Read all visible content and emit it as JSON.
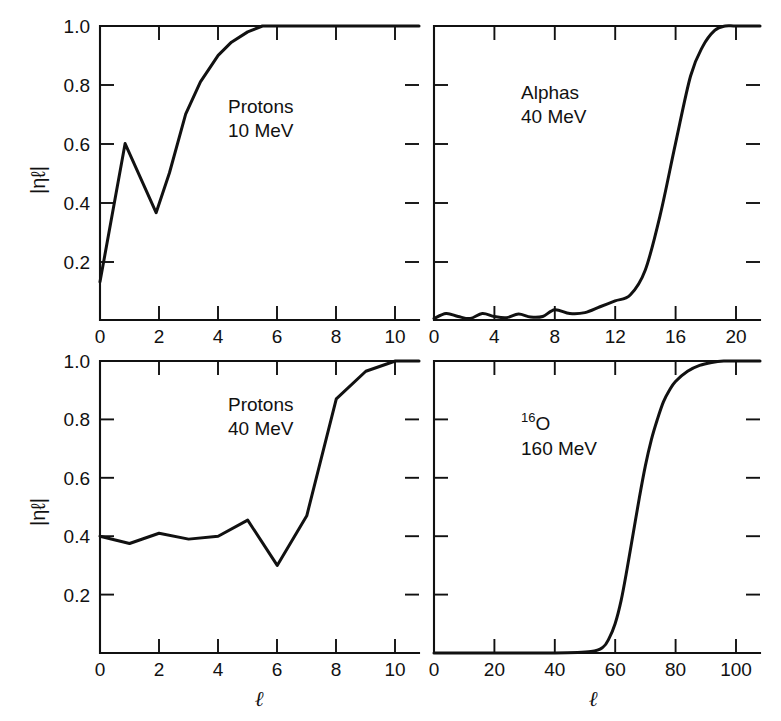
{
  "figure": {
    "background_color": "#ffffff",
    "line_color": "#111111",
    "text_color": "#111111",
    "y_axis_label": "|ηℓ|",
    "x_axis_label": "ℓ"
  },
  "panels": [
    {
      "id": "protons-10mev",
      "position": "top-left",
      "annotation_line1": "Protons",
      "annotation_line2": "10 MeV",
      "annotation_superscript": "",
      "annotation_base": ""
    },
    {
      "id": "alphas-40mev",
      "position": "top-right",
      "annotation_line1": "Alphas",
      "annotation_line2": "40 MeV",
      "annotation_superscript": "",
      "annotation_base": ""
    },
    {
      "id": "protons-40mev",
      "position": "bottom-left",
      "annotation_line1": "Protons",
      "annotation_line2": "40 MeV",
      "annotation_superscript": "",
      "annotation_base": ""
    },
    {
      "id": "o16-160mev",
      "position": "bottom-right",
      "annotation_line1": "",
      "annotation_line2": "160 MeV",
      "annotation_superscript": "16",
      "annotation_base": "O"
    }
  ],
  "chart_data": [
    {
      "type": "line",
      "panel_id": "protons-10mev",
      "title": "Protons 10 MeV",
      "xlabel": "ℓ",
      "ylabel": "|ηℓ|",
      "xlim": [
        0,
        10.8
      ],
      "ylim": [
        0.0,
        1.0
      ],
      "xticks": [
        0,
        2,
        4,
        6,
        8,
        10
      ],
      "xticklabels": [
        "0",
        "2",
        "4",
        "6",
        "8",
        "10"
      ],
      "yticks": [
        0.2,
        0.4,
        0.6,
        0.8,
        1.0
      ],
      "yticklabels": [
        "0.2",
        "0.4",
        "0.6",
        "0.8",
        "1.0"
      ],
      "grid": false,
      "legend": "none",
      "x": [
        0.0,
        0.85,
        1.9,
        2.35,
        2.9,
        3.4,
        4.0,
        4.45,
        5.0,
        5.5,
        6.0,
        8.0,
        10.0,
        10.8
      ],
      "y": [
        0.13,
        0.6,
        0.365,
        0.5,
        0.7,
        0.81,
        0.9,
        0.945,
        0.98,
        1.0,
        1.0,
        1.0,
        1.0,
        1.0
      ]
    },
    {
      "type": "line",
      "panel_id": "alphas-40mev",
      "title": "Alphas 40 MeV",
      "xlabel": "ℓ",
      "ylabel": "|ηℓ|",
      "xlim": [
        0,
        21.6
      ],
      "ylim": [
        0.0,
        1.0
      ],
      "xticks": [
        0,
        4,
        8,
        12,
        16,
        20
      ],
      "xticklabels": [
        "0",
        "4",
        "8",
        "12",
        "16",
        "20"
      ],
      "yticks": [
        0.2,
        0.4,
        0.6,
        0.8,
        1.0
      ],
      "yticklabels": [
        "",
        "",
        "",
        "",
        ""
      ],
      "grid": false,
      "legend": "none",
      "x": [
        0.0,
        0.8,
        1.6,
        2.4,
        3.2,
        4.0,
        4.8,
        5.6,
        6.4,
        7.2,
        8.0,
        9.0,
        10.0,
        11.0,
        12.0,
        13.0,
        14.0,
        15.0,
        16.0,
        17.0,
        17.8,
        18.6,
        19.3,
        20.0,
        21.6
      ],
      "y": [
        0.005,
        0.022,
        0.012,
        0.005,
        0.022,
        0.012,
        0.008,
        0.02,
        0.01,
        0.012,
        0.035,
        0.022,
        0.025,
        0.045,
        0.065,
        0.085,
        0.17,
        0.36,
        0.6,
        0.83,
        0.93,
        0.985,
        1.0,
        1.0,
        1.0
      ]
    },
    {
      "type": "line",
      "panel_id": "protons-40mev",
      "title": "Protons 40 MeV",
      "xlabel": "ℓ",
      "ylabel": "|ηℓ|",
      "xlim": [
        0,
        10.8
      ],
      "ylim": [
        0.0,
        1.0
      ],
      "xticks": [
        0,
        2,
        4,
        6,
        8,
        10
      ],
      "xticklabels": [
        "0",
        "2",
        "4",
        "6",
        "8",
        "10"
      ],
      "yticks": [
        0.2,
        0.4,
        0.6,
        0.8,
        1.0
      ],
      "yticklabels": [
        "0.2",
        "0.4",
        "0.6",
        "0.8",
        "1.0"
      ],
      "grid": false,
      "legend": "none",
      "x": [
        0.0,
        1.0,
        2.0,
        3.0,
        4.0,
        5.0,
        6.0,
        7.0,
        8.0,
        9.0,
        10.0,
        10.8
      ],
      "y": [
        0.4,
        0.375,
        0.41,
        0.39,
        0.4,
        0.455,
        0.3,
        0.47,
        0.87,
        0.965,
        1.0,
        1.0
      ]
    },
    {
      "type": "line",
      "panel_id": "o16-160mev",
      "title": "16O 160 MeV",
      "xlabel": "ℓ",
      "ylabel": "|ηℓ|",
      "xlim": [
        0,
        108
      ],
      "ylim": [
        0.0,
        1.0
      ],
      "xticks": [
        0,
        20,
        40,
        60,
        80,
        100
      ],
      "xticklabels": [
        "0",
        "20",
        "40",
        "60",
        "80",
        "100"
      ],
      "yticks": [
        0.2,
        0.4,
        0.6,
        0.8,
        1.0
      ],
      "yticklabels": [
        "",
        "",
        "",
        "",
        ""
      ],
      "grid": false,
      "legend": "none",
      "x": [
        0,
        20,
        40,
        52,
        56,
        58,
        60,
        62,
        64,
        66,
        68,
        70,
        72,
        74,
        76,
        78,
        80,
        84,
        88,
        92,
        96,
        100,
        108
      ],
      "y": [
        0.0,
        0.0,
        0.0,
        0.005,
        0.02,
        0.05,
        0.1,
        0.18,
        0.29,
        0.41,
        0.53,
        0.64,
        0.73,
        0.8,
        0.86,
        0.9,
        0.93,
        0.965,
        0.985,
        0.995,
        1.0,
        1.0,
        1.0
      ]
    }
  ]
}
